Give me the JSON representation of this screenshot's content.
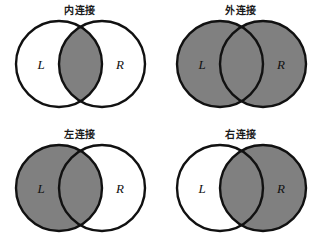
{
  "figure": {
    "name": "sql-join-venn-diagrams",
    "background_color": "#ffffff",
    "shade_color": "#808080",
    "unshaded_color": "#ffffff",
    "stroke_color": "#111111",
    "columns": 2,
    "rows": 2
  },
  "diagrams": [
    {
      "id": "inner-join",
      "title": "内连接",
      "left_label": "L",
      "right_label": "R",
      "shaded_regions": [
        "intersection"
      ],
      "left_circle_filled": false,
      "right_circle_filled": false,
      "intersection_filled": true
    },
    {
      "id": "outer-join",
      "title": "外连接",
      "left_label": "L",
      "right_label": "R",
      "shaded_regions": [
        "left-only",
        "intersection",
        "right-only"
      ],
      "left_circle_filled": true,
      "right_circle_filled": true,
      "intersection_filled": true
    },
    {
      "id": "left-join",
      "title": "左连接",
      "left_label": "L",
      "right_label": "R",
      "shaded_regions": [
        "left-only",
        "intersection"
      ],
      "left_circle_filled": true,
      "right_circle_filled": false,
      "intersection_filled": true
    },
    {
      "id": "right-join",
      "title": "右连接",
      "left_label": "L",
      "right_label": "R",
      "shaded_regions": [
        "intersection",
        "right-only"
      ],
      "left_circle_filled": false,
      "right_circle_filled": true,
      "intersection_filled": true
    }
  ]
}
